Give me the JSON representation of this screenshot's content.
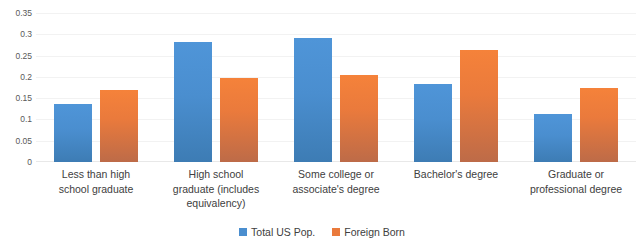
{
  "chart_data": {
    "type": "bar",
    "title": "",
    "subtitle": "",
    "xlabel": "",
    "ylabel": "",
    "ylim": [
      0,
      0.35
    ],
    "ytick_labels": [
      "0.35",
      "0.3",
      "0.25",
      "0.2",
      "0.15",
      "0.1",
      "0.05",
      "0"
    ],
    "ytick_values": [
      0.35,
      0.3,
      0.25,
      0.2,
      0.15,
      0.1,
      0.05,
      0
    ],
    "grid": "horizontal",
    "legend_position": "bottom-center",
    "categories": [
      "Less than high school graduate",
      "High school graduate (includes equivalency)",
      "Some college or associate's degree",
      "Bachelor's degree",
      "Graduate or professional degree"
    ],
    "category_label_lines": [
      [
        "Less than high",
        "school graduate"
      ],
      [
        "High school",
        "graduate (includes",
        "equivalency)"
      ],
      [
        "Some college or",
        "associate's degree"
      ],
      [
        "Bachelor's degree"
      ],
      [
        "Graduate or",
        "professional degree"
      ]
    ],
    "series": [
      {
        "name": "Total US Pop.",
        "color": "#4a8ecf",
        "values": [
          0.137,
          0.281,
          0.291,
          0.183,
          0.113
        ]
      },
      {
        "name": "Foreign Born",
        "color": "#ea7a3c",
        "values": [
          0.168,
          0.198,
          0.205,
          0.262,
          0.174
        ]
      }
    ]
  },
  "legend": {
    "items": [
      {
        "label": "Total US Pop.",
        "swatch": "blue"
      },
      {
        "label": "Foreign Born",
        "swatch": "orange"
      }
    ]
  },
  "colors": {
    "series_blue": "#4a8ecf",
    "series_orange": "#ea7a3c",
    "gridline": "#f2f2f2",
    "text": "#404040",
    "axis_text": "#595959",
    "background": "#ffffff"
  }
}
